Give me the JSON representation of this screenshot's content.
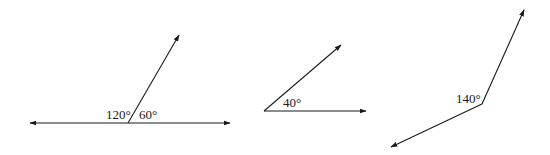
{
  "diagram": {
    "figures": [
      {
        "id": "linear-pair",
        "labels": [
          "120°",
          "60°"
        ],
        "angles_deg": [
          120,
          60
        ]
      },
      {
        "id": "acute-angle",
        "labels": [
          "40°"
        ],
        "angles_deg": [
          40
        ]
      },
      {
        "id": "obtuse-angle",
        "labels": [
          "140°"
        ],
        "angles_deg": [
          140
        ]
      }
    ]
  },
  "labels": {
    "fig1_left": "120°",
    "fig1_right": "60°",
    "fig2": "40°",
    "fig3": "140°"
  },
  "colors": {
    "stroke": "#1a1a1a",
    "background": "#ffffff"
  }
}
